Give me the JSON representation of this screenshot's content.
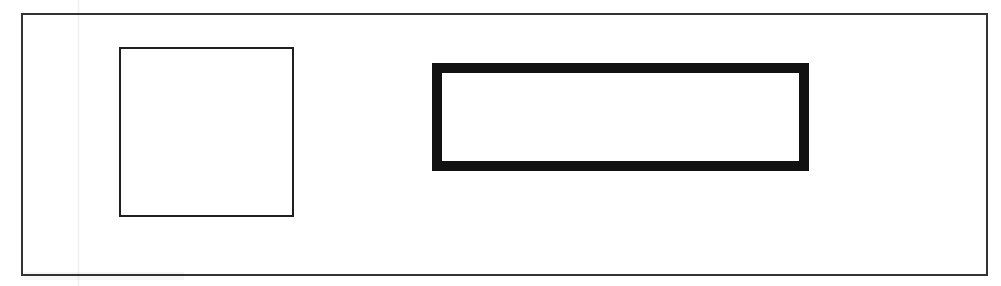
{
  "document": {
    "type": "scanned-figure",
    "title": "Scanned line-art figure with two rectangles",
    "width": 1001,
    "height": 286,
    "background_color": "#ffffff",
    "ink_color": "#1a1a1a"
  },
  "outer_frame": {
    "name": "outer border frame",
    "shape": "rectangle",
    "stroke_color": "#333333",
    "stroke_width_px": 2,
    "fill": "none",
    "x": 21,
    "y": 13,
    "width": 967,
    "height": 263
  },
  "shapes": [
    {
      "id": "thin-square",
      "label": "thin-stroked square",
      "shape": "rectangle",
      "stroke_color": "#1f1f1f",
      "stroke_width_px": 2,
      "fill": "#ffffff",
      "x": 119,
      "y": 47,
      "width": 175,
      "height": 170
    },
    {
      "id": "thick-rectangle",
      "label": "thick-stroked wide rectangle",
      "shape": "rectangle",
      "stroke_color": "#111111",
      "stroke_width_px": 10,
      "fill": "#ffffff",
      "x": 432,
      "y": 63,
      "width": 377,
      "height": 108
    }
  ],
  "artifacts": [
    {
      "id": "vertical-scan-streak",
      "label": "faint vertical scanner streak",
      "x": 77,
      "y": 0,
      "width": 3,
      "height": 286
    },
    {
      "id": "bottom-left-smudge",
      "label": "faint toner smudge",
      "x": 24,
      "y": 272,
      "width": 160,
      "height": 8
    }
  ]
}
